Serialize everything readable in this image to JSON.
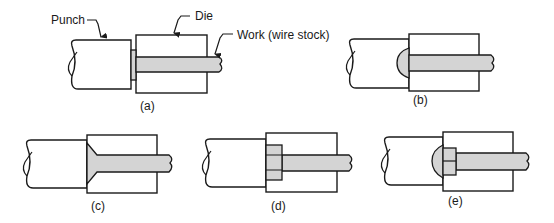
{
  "diagram": {
    "type": "process-sequence",
    "colors": {
      "stroke": "#1a1a1a",
      "work_fill": "#d4d4d4",
      "background": "#ffffff"
    },
    "labels": {
      "punch": "Punch",
      "die": "Die",
      "work": "Work (wire stock)"
    },
    "panels": [
      {
        "id": "a",
        "caption": "(a)",
        "head_shape": "none (wire positioned against punch)"
      },
      {
        "id": "b",
        "caption": "(b)",
        "head_shape": "round dome"
      },
      {
        "id": "c",
        "caption": "(c)",
        "head_shape": "countersunk (conical)"
      },
      {
        "id": "d",
        "caption": "(d)",
        "head_shape": "hexagonal"
      },
      {
        "id": "e",
        "caption": "(e)",
        "head_shape": "hexagonal with round dome"
      }
    ]
  }
}
